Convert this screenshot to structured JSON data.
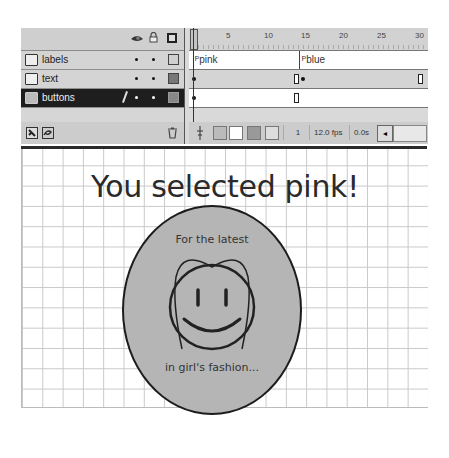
{
  "timeline": {
    "header_icons": [
      "eye-icon",
      "lock-icon",
      "outline-icon"
    ],
    "layers": [
      {
        "name": "labels",
        "selected": false
      },
      {
        "name": "text",
        "selected": false
      },
      {
        "name": "buttons",
        "selected": true
      }
    ],
    "ruler_labels": [
      "5",
      "10",
      "15",
      "20",
      "25",
      "30"
    ],
    "frame_labels": {
      "pink": "pink",
      "blue": "blue"
    },
    "footer_icons": [
      "insert-layer-icon",
      "add-guide-layer-icon",
      "trash-icon"
    ],
    "frame_toolbar_icons": [
      "center-frame-icon",
      "onion-skin-icon",
      "onion-skin-outlines-icon",
      "edit-multiple-frames-icon",
      "modify-onion-markers-icon"
    ],
    "status": {
      "current_frame": "1",
      "frame_rate": "12.0 fps",
      "elapsed_time": "0.0s"
    }
  },
  "stage": {
    "headline": "You selected pink!",
    "badge": {
      "top_text": "For the latest",
      "bottom_text": "in girl's fashion..."
    }
  },
  "colors": {
    "panel_bg": "#d6d6d6",
    "selected_layer": "#1e1e1e",
    "badge_fill": "#b5b5b5",
    "grid_line": "#c8c8c8"
  }
}
